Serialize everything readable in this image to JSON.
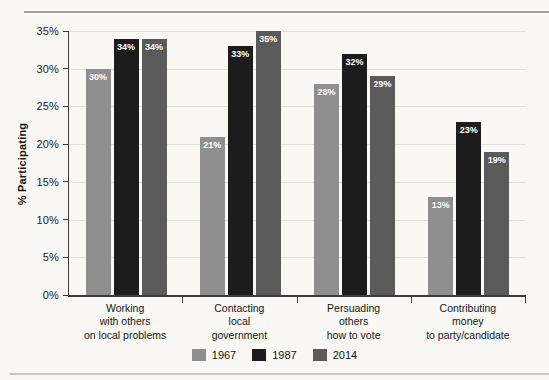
{
  "page": {
    "kind": "scanned-book-figure"
  },
  "chart_data": {
    "type": "bar",
    "title": "",
    "xlabel": "",
    "ylabel": "% Participating",
    "ylim": [
      0,
      35
    ],
    "ytick_step": 5,
    "ytick_labels": [
      "0%",
      "5%",
      "10%",
      "15%",
      "20%",
      "25%",
      "30%",
      "35%"
    ],
    "grid": true,
    "legend_position": "bottom-center",
    "categories": [
      "Working\nwith others\non local problems",
      "Contacting\nlocal\ngovernment",
      "Persuading\nothers\nhow to vote",
      "Contributing\nmoney\nto party/candidate"
    ],
    "series": [
      {
        "name": "1967",
        "color": "#8f8f8f",
        "values": [
          30,
          21,
          28,
          13
        ]
      },
      {
        "name": "1987",
        "color": "#1c1c1c",
        "values": [
          34,
          33,
          32,
          23
        ]
      },
      {
        "name": "2014",
        "color": "#5a5a5a",
        "values": [
          34,
          35,
          29,
          19
        ]
      }
    ],
    "value_label_suffix": "%",
    "value_label_color": "#ffffff"
  },
  "colors": {
    "paper": "#f9f8f4",
    "axis": "#3c3c3c",
    "gridline": "#e0e0da",
    "rule_top": "#a3a39c",
    "rule_bottom": "#c6c6be"
  }
}
